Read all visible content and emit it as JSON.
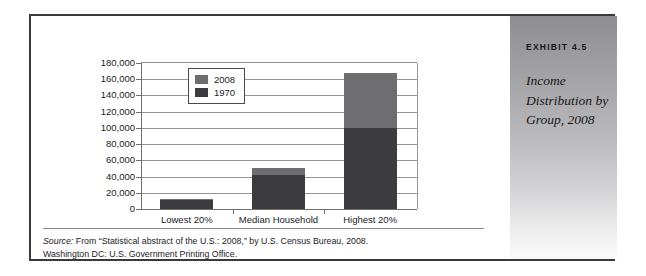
{
  "exhibit": {
    "number": "EXHIBIT 4.5",
    "title": "Income Distribution by Group, 2008"
  },
  "source_note": {
    "label": "Source:",
    "line1": " From “Statistical abstract of the U.S.: 2008,” by U.S. Census Bureau, 2008.",
    "line2": "Washington DC: U.S. Government Printing Office."
  },
  "chart_data": {
    "type": "bar",
    "subtype": "stacked-vertical",
    "title": "",
    "xlabel": "",
    "ylabel": "",
    "ylim": [
      0,
      180000
    ],
    "ytick_step": 20000,
    "ytick_labels": [
      "180,000",
      "160,000",
      "140,000",
      "120,000",
      "100,000",
      "80,000",
      "60,000",
      "40,000",
      "20,000",
      "0"
    ],
    "ytick_values": [
      180000,
      160000,
      140000,
      120000,
      100000,
      80000,
      60000,
      40000,
      20000,
      0
    ],
    "grid": true,
    "grid_axis": "y",
    "legend_position": "top-left-inside",
    "categories": [
      "Lowest 20%",
      "Median Household",
      "Highest 20%"
    ],
    "series": [
      {
        "name": "1970",
        "color": "#3b3b3d",
        "values": [
          11000,
          42000,
          100000
        ]
      },
      {
        "name": "2008",
        "color": "#6e6e70",
        "values": [
          12000,
          50000,
          168000
        ]
      }
    ],
    "stack_note": "Each bar is drawn as a stack: the dark 1970 value from the baseline, the lighter 2008 band above it up to the 2008 total.",
    "legend_entries": [
      "2008",
      "1970"
    ]
  }
}
